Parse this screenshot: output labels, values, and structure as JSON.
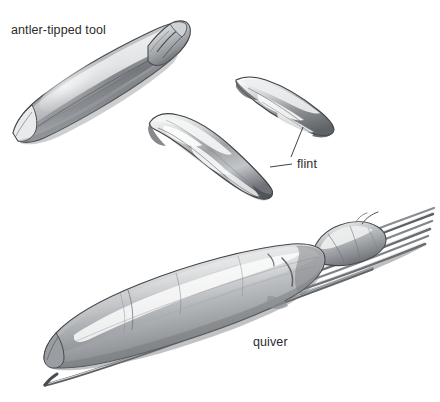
{
  "figure": {
    "medium": "grayscale pencil / wash drawing",
    "background_color": "#ffffff",
    "ink_color": "#2b2b2b",
    "width": 440,
    "height": 402
  },
  "labels": {
    "antler_tool": "antler-tipped tool",
    "flint": "flint",
    "quiver": "quiver"
  },
  "objects": [
    {
      "id": "antler-tipped-tool",
      "label": "antler-tipped tool",
      "description": "long tapered antler shaft with grooved channel, pointed at lower-left, notched collar butt at upper-right",
      "orientation": "diagonal, lower-left to upper-right"
    },
    {
      "id": "flint-blade-middle",
      "label": "flint",
      "description": "elongated faceted flint blade with flake scars",
      "orientation": "diagonal, upper-left to lower-right"
    },
    {
      "id": "flint-blade-upper-right",
      "label": "flint",
      "description": "slender leaf-shaped flint blade",
      "orientation": "diagonal, upper-left to lower-right"
    },
    {
      "id": "quiver",
      "label": "quiver",
      "description": "hide tube quiver with bundle of arrow shafts protruding from upper-right mouth, lumpy pouch cap, and one loose long shaft beneath",
      "orientation": "diagonal, lower-left to upper-right"
    }
  ],
  "leader_lines": [
    {
      "from": "flint-label",
      "to": "flint-blade-upper-right"
    },
    {
      "from": "flint-label",
      "to": "flint-blade-middle"
    }
  ],
  "palette": {
    "ink": "#2b2b2b",
    "outline": "#3a3a3a",
    "shadow_dark": "#5d5f62",
    "shadow_mid": "#8d9094",
    "shadow_light": "#b9bcbf",
    "highlight": "#f2f3f4",
    "paper": "#ffffff"
  }
}
